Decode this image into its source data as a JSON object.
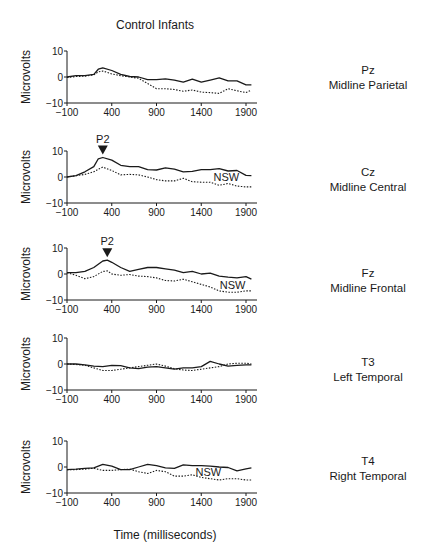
{
  "title": "Control Infants",
  "x_axis_label": "Time (milliseconds)",
  "y_axis_label": "Microvolts",
  "x_ticks": [
    -100,
    400,
    900,
    1400,
    1900
  ],
  "y_ticks": [
    10,
    0,
    -10
  ],
  "colors": {
    "solid": "#1a1a1a",
    "dotted": "#1a1a1a"
  },
  "chart_data": [
    {
      "type": "line",
      "title": "Pz Midline Parietal",
      "electrode": "Pz",
      "region": "Midline Parietal",
      "xlabel": "Time (milliseconds)",
      "ylabel": "Microvolts",
      "xlim": [
        -100,
        2000
      ],
      "ylim": [
        -10,
        10
      ],
      "x": [
        -100,
        0,
        100,
        200,
        250,
        300,
        400,
        500,
        600,
        700,
        800,
        900,
        1000,
        1100,
        1200,
        1300,
        1400,
        1500,
        1600,
        1700,
        1800,
        1900,
        1960
      ],
      "series": [
        {
          "name": "solid",
          "values": [
            0,
            0.5,
            0.5,
            1,
            3,
            3.5,
            2.5,
            1,
            0.2,
            0,
            -1,
            -1,
            -0.7,
            -1.2,
            -2,
            -0.8,
            -2,
            -1.2,
            -0.3,
            -1.5,
            -1.5,
            -3,
            -3
          ]
        },
        {
          "name": "dotted",
          "values": [
            -0.2,
            0.2,
            0.3,
            0.8,
            2,
            2.3,
            1.2,
            0.5,
            0,
            -0.5,
            -2.5,
            -4.5,
            -4.5,
            -4.8,
            -5.5,
            -5,
            -5.8,
            -6,
            -6.3,
            -4.5,
            -5.3,
            -6,
            -5
          ]
        }
      ],
      "annotations": []
    },
    {
      "type": "line",
      "title": "Cz Midline Central",
      "electrode": "Cz",
      "region": "Midline Central",
      "xlabel": "Time (milliseconds)",
      "ylabel": "Microvolts",
      "xlim": [
        -100,
        2000
      ],
      "ylim": [
        -10,
        10
      ],
      "x": [
        -100,
        0,
        100,
        200,
        250,
        300,
        400,
        500,
        600,
        700,
        800,
        900,
        1000,
        1100,
        1200,
        1300,
        1400,
        1500,
        1600,
        1700,
        1800,
        1900,
        1960
      ],
      "series": [
        {
          "name": "solid",
          "values": [
            0,
            0.5,
            2,
            4,
            7,
            7.5,
            6.5,
            4.5,
            4,
            4,
            2.8,
            2.7,
            3.5,
            3,
            2,
            2.2,
            2.8,
            2.8,
            3.2,
            2.3,
            2.5,
            0.6,
            0.5
          ]
        },
        {
          "name": "dotted",
          "values": [
            0,
            0.5,
            1,
            2,
            3,
            3.8,
            2.5,
            0.8,
            1,
            0.8,
            0,
            -1,
            -1.5,
            -1.5,
            -0.5,
            -1.8,
            -2,
            -2,
            -3.2,
            -2.5,
            -3.5,
            -3.8,
            -3.8
          ]
        }
      ],
      "annotations": [
        {
          "text": "P2",
          "type": "peak-marker",
          "t": 300
        },
        {
          "text": "NSW",
          "type": "label",
          "t": 1680
        }
      ]
    },
    {
      "type": "line",
      "title": "Fz Midline Frontal",
      "electrode": "Fz",
      "region": "Midline Frontal",
      "xlabel": "Time (milliseconds)",
      "ylabel": "Microvolts",
      "xlim": [
        -100,
        2000
      ],
      "ylim": [
        -10,
        10
      ],
      "x": [
        -100,
        0,
        100,
        200,
        300,
        350,
        400,
        500,
        600,
        700,
        800,
        900,
        1000,
        1100,
        1200,
        1300,
        1400,
        1500,
        1600,
        1700,
        1800,
        1900,
        1960
      ],
      "series": [
        {
          "name": "solid",
          "values": [
            0.5,
            0.5,
            1,
            2.5,
            5,
            5.3,
            4.5,
            2.5,
            1,
            1.8,
            2.5,
            2.5,
            2,
            1.5,
            0.5,
            1,
            0,
            0.3,
            -0.8,
            -1.2,
            -1.5,
            -1,
            -2
          ]
        },
        {
          "name": "dotted",
          "values": [
            0.5,
            -0.5,
            -1.8,
            -1,
            1,
            1.2,
            0,
            -0.5,
            -0.2,
            -0.8,
            -1,
            -1.5,
            -2.5,
            -2.7,
            -2,
            -3,
            -4,
            -5,
            -6.5,
            -7,
            -7,
            -6.5,
            -6.5
          ]
        }
      ],
      "annotations": [
        {
          "text": "P2",
          "type": "peak-marker",
          "t": 350
        },
        {
          "text": "NSW",
          "type": "label",
          "t": 1750
        }
      ]
    },
    {
      "type": "line",
      "title": "T3 Left Temporal",
      "electrode": "T3",
      "region": "Left Temporal",
      "xlabel": "Time (milliseconds)",
      "ylabel": "Microvolts",
      "xlim": [
        -100,
        2000
      ],
      "ylim": [
        -10,
        10
      ],
      "x": [
        -100,
        0,
        100,
        200,
        300,
        400,
        500,
        600,
        700,
        800,
        900,
        1000,
        1100,
        1200,
        1300,
        1400,
        1500,
        1600,
        1700,
        1800,
        1900,
        1960
      ],
      "series": [
        {
          "name": "solid",
          "values": [
            0,
            0,
            -0.3,
            -0.8,
            -1,
            -0.5,
            -0.6,
            -1.5,
            -1.8,
            -1.2,
            -1,
            -1.5,
            -2,
            -1.5,
            -1.5,
            -1,
            1,
            0,
            -0.8,
            -0.5,
            -0.3,
            -0.3
          ]
        },
        {
          "name": "dotted",
          "values": [
            0,
            -0.2,
            -0.5,
            -1.5,
            -2.5,
            -2.5,
            -2,
            -1.5,
            -1,
            -0.5,
            0,
            -0.8,
            -1.8,
            -2.3,
            -2.5,
            -2,
            -1.5,
            -1,
            0,
            0.3,
            0.3,
            0
          ]
        }
      ],
      "annotations": []
    },
    {
      "type": "line",
      "title": "T4 Right Temporal",
      "electrode": "T4",
      "region": "Right Temporal",
      "xlabel": "Time (milliseconds)",
      "ylabel": "Microvolts",
      "xlim": [
        -100,
        2000
      ],
      "ylim": [
        -10,
        10
      ],
      "x": [
        -100,
        0,
        100,
        200,
        300,
        400,
        500,
        600,
        700,
        800,
        900,
        1000,
        1100,
        1200,
        1300,
        1400,
        1500,
        1600,
        1700,
        1800,
        1900,
        1960
      ],
      "series": [
        {
          "name": "solid",
          "values": [
            -1,
            -0.8,
            -0.5,
            -0.3,
            1,
            0.3,
            -1,
            -1,
            0,
            1,
            0.5,
            -0.3,
            -0.5,
            0.8,
            0.5,
            0.5,
            0.3,
            0,
            -0.2,
            -1.5,
            -0.7,
            -0.3
          ]
        },
        {
          "name": "dotted",
          "values": [
            -1,
            -1,
            -0.8,
            -0.5,
            -1.3,
            -1.3,
            -1,
            -0.8,
            -1.8,
            -2.5,
            -1.3,
            -1.8,
            -3.5,
            -3.5,
            -3,
            -4,
            -4.5,
            -5,
            -4.5,
            -4.5,
            -5,
            -5
          ]
        }
      ],
      "annotations": [
        {
          "text": "NSW",
          "type": "label",
          "t": 1480
        }
      ]
    }
  ],
  "panels": [
    {
      "electrode": "Pz",
      "region": "Midline Parietal"
    },
    {
      "electrode": "Cz",
      "region": "Midline Central"
    },
    {
      "electrode": "Fz",
      "region": "Midline Frontal"
    },
    {
      "electrode": "T3",
      "region": "Left Temporal"
    },
    {
      "electrode": "T4",
      "region": "Right Temporal"
    }
  ]
}
